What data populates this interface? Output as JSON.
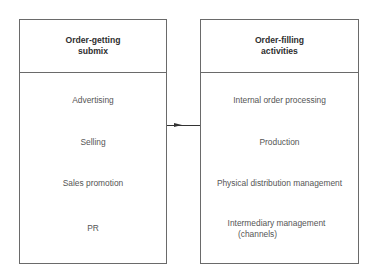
{
  "diagram": {
    "left_box": {
      "title_line1": "Order-getting",
      "title_line2": "submix",
      "items": [
        "Advertising",
        "Selling",
        "Sales promotion",
        "PR"
      ]
    },
    "right_box": {
      "title_line1": "Order-filling",
      "title_line2": "activities",
      "items": [
        "Internal order processing",
        "Production",
        "Physical distribution management",
        "Intermediary management",
        "(channels)"
      ]
    },
    "connector": {
      "direction": "left-to-right",
      "color": "#333333"
    }
  }
}
